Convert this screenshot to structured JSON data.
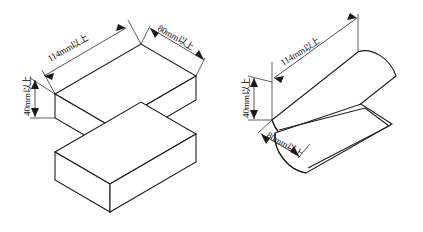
{
  "drawing": {
    "title": "",
    "background_color": "#ffffff",
    "line_color": "#1a1a1a",
    "text_color": "#111111",
    "figures": [
      {
        "id": "left-figure",
        "name": "rectangular-block-pair",
        "description": "Two separated isometric rectangular blocks",
        "dimensions": [
          {
            "key": "length",
            "label": "114mm以上"
          },
          {
            "key": "width",
            "label": "80mm以上"
          },
          {
            "key": "height",
            "label": "40mm以上"
          }
        ]
      },
      {
        "id": "right-figure",
        "name": "half-cylinder-pair",
        "description": "Upper convex half-cylinder above a lower half-cylinder trough",
        "dimensions": [
          {
            "key": "length",
            "label": "114mm以上"
          },
          {
            "key": "width",
            "label": "80mm以上"
          },
          {
            "key": "height",
            "label": "40mm以上"
          }
        ]
      }
    ],
    "labels": {
      "left_length": "114mm以上",
      "left_width": "80mm以上",
      "left_height": "40mm以上",
      "right_length": "114mm以上",
      "right_width": "80mm以上",
      "right_height": "40mm以上"
    }
  }
}
